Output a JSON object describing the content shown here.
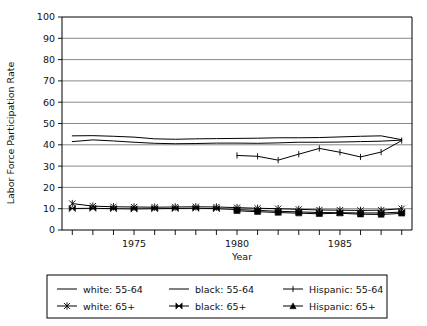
{
  "chart_data": {
    "type": "line",
    "title": "",
    "xlabel": "Year",
    "ylabel": "Labor Force Participation Rate",
    "xlim": [
      1971.5,
      1988.5
    ],
    "ylim": [
      0,
      100
    ],
    "ytick_step": 10,
    "yticks": [
      0,
      10,
      20,
      30,
      40,
      50,
      60,
      70,
      80,
      90,
      100
    ],
    "ytick_labels": [
      "0",
      "10",
      "20",
      "30",
      "40",
      "50",
      "60",
      "70",
      "80",
      "90",
      "100"
    ],
    "xticks": [
      1972,
      1973,
      1974,
      1975,
      1976,
      1977,
      1978,
      1979,
      1980,
      1981,
      1982,
      1983,
      1984,
      1985,
      1986,
      1987,
      1988
    ],
    "xtick_labels_shown": [
      "1975",
      "1980",
      "1985"
    ],
    "xtick_labels_shown_values": [
      1975,
      1980,
      1985
    ],
    "grid": "horizontal",
    "legend_position": "below-plot",
    "series": [
      {
        "name": "white: 55-64",
        "marker": "none",
        "x": [
          1972,
          1973,
          1974,
          1975,
          1976,
          1977,
          1978,
          1979,
          1980,
          1981,
          1982,
          1983,
          1984,
          1985,
          1986,
          1987,
          1988
        ],
        "values": [
          44.2,
          44.3,
          44.0,
          43.6,
          42.8,
          42.6,
          42.8,
          42.9,
          43.0,
          43.1,
          43.3,
          43.3,
          43.4,
          43.7,
          44.0,
          44.2,
          42.4
        ]
      },
      {
        "name": "black: 55-64",
        "marker": "none",
        "x": [
          1972,
          1973,
          1974,
          1975,
          1976,
          1977,
          1978,
          1979,
          1980,
          1981,
          1982,
          1983,
          1984,
          1985,
          1986,
          1987,
          1988
        ],
        "values": [
          41.5,
          42.3,
          41.8,
          41.2,
          40.7,
          40.5,
          40.6,
          40.8,
          40.8,
          40.7,
          40.9,
          41.2,
          41.2,
          41.3,
          41.5,
          41.7,
          42.2
        ]
      },
      {
        "name": "Hispanic: 55-64",
        "marker": "plus",
        "x": [
          1980,
          1981,
          1982,
          1983,
          1984,
          1985,
          1986,
          1987,
          1988
        ],
        "values": [
          35.0,
          34.6,
          32.8,
          35.6,
          38.3,
          36.5,
          34.3,
          36.6,
          42.0
        ]
      },
      {
        "name": "white: 65+",
        "marker": "asterisk",
        "x": [
          1972,
          1973,
          1974,
          1975,
          1976,
          1977,
          1978,
          1979,
          1980,
          1981,
          1982,
          1983,
          1984,
          1985,
          1986,
          1987,
          1988
        ],
        "values": [
          12.4,
          11.2,
          10.9,
          10.8,
          10.7,
          10.8,
          10.9,
          10.8,
          10.5,
          10.2,
          10.0,
          9.7,
          9.4,
          9.3,
          9.2,
          9.3,
          10.0
        ]
      },
      {
        "name": "black: 65+",
        "marker": "bowtie",
        "x": [
          1972,
          1973,
          1974,
          1975,
          1976,
          1977,
          1978,
          1979,
          1980,
          1981,
          1982,
          1983,
          1984,
          1985,
          1986,
          1987,
          1988
        ],
        "values": [
          10.1,
          10.2,
          10.0,
          9.9,
          10.0,
          10.1,
          10.2,
          10.0,
          9.6,
          9.2,
          8.8,
          8.5,
          8.2,
          8.1,
          8.0,
          8.0,
          8.4
        ]
      },
      {
        "name": "Hispanic: 65+",
        "marker": "triangle",
        "x": [
          1980,
          1981,
          1982,
          1983,
          1984,
          1985,
          1986,
          1987,
          1988
        ],
        "values": [
          9.0,
          8.6,
          8.2,
          7.9,
          7.6,
          7.9,
          7.4,
          7.3,
          7.8
        ]
      }
    ]
  },
  "legend": {
    "entries": [
      {
        "label": "white: 55-64",
        "marker": "none"
      },
      {
        "label": "black: 55-64",
        "marker": "none"
      },
      {
        "label": "Hispanic: 55-64",
        "marker": "plus"
      },
      {
        "label": "white: 65+",
        "marker": "asterisk"
      },
      {
        "label": "black: 65+",
        "marker": "bowtie"
      },
      {
        "label": "Hispanic: 65+",
        "marker": "triangle"
      }
    ]
  },
  "colors": {
    "ink": "#000000",
    "grid": "#555555",
    "background": "#ffffff"
  }
}
